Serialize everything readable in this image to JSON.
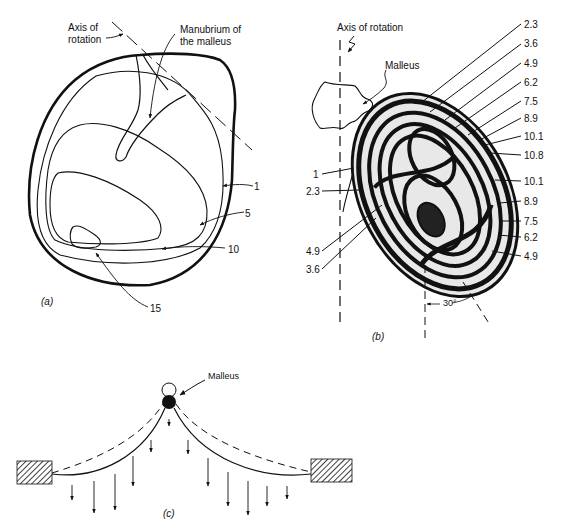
{
  "figure": {
    "panel_a": {
      "label": "(a)",
      "annotations": {
        "axis_line1": "Axis of",
        "axis_line2": "rotation",
        "manubrium_line1": "Manubrium of",
        "manubrium_line2": "the malleus"
      },
      "contour_labels": [
        "1",
        "5",
        "10",
        "15"
      ]
    },
    "panel_b": {
      "label": "(b)",
      "annotations": {
        "axis": "Axis of rotation",
        "malleus": "Malleus",
        "angle": "30°"
      },
      "right_labels": [
        "2.3",
        "3.6",
        "4.9",
        "6.2",
        "7.5",
        "8.9",
        "10.1",
        "10.8",
        "10.1",
        "8.9",
        "7.5",
        "6.2",
        "4.9"
      ],
      "left_labels": [
        "1",
        "2.3",
        "4.9",
        "3.6"
      ]
    },
    "panel_c": {
      "label": "(c)",
      "annotations": {
        "malleus": "Malleus"
      }
    }
  }
}
